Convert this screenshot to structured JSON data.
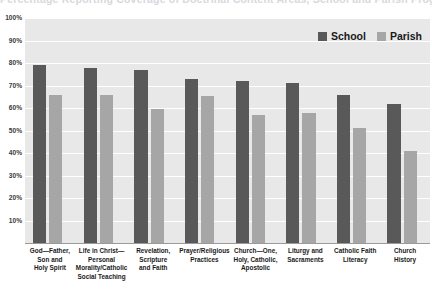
{
  "chart_data": {
    "type": "bar",
    "title": "Percentage Reporting Coverage of Doctrinal Content Areas, School and Parish Programs",
    "xlabel": "",
    "ylabel": "",
    "ylim": [
      0,
      100
    ],
    "ytick_labels": [
      "100%",
      "90%",
      "80%",
      "70%",
      "60%",
      "50%",
      "40%",
      "30%",
      "20%",
      "10%"
    ],
    "ytick_values": [
      100,
      90,
      80,
      70,
      60,
      50,
      40,
      30,
      20,
      10
    ],
    "grid": true,
    "legend_position": "top-right",
    "categories": [
      "God—Father, Son and Holy Spirit",
      "Life in Christ—Personal Morality/Catholic Social Teaching",
      "Revelation, Scripture and Faith",
      "Prayer/Religious Practices",
      "Church—One, Holy, Catholic, Apostolic",
      "Liturgy and Sacraments",
      "Catholic Faith Literacy",
      "Church History"
    ],
    "category_lines": [
      [
        "God—Father,",
        "Son and",
        "Holy Spirit"
      ],
      [
        "Life in Christ—",
        "Personal",
        "Morality/Catholic",
        "Social Teaching"
      ],
      [
        "Revelation,",
        "Scripture",
        "and Faith"
      ],
      [
        "Prayer/Religious",
        "Practices"
      ],
      [
        "Church—One,",
        "Holy, Catholic,",
        "Apostolic"
      ],
      [
        "Liturgy and",
        "Sacraments"
      ],
      [
        "Catholic Faith",
        "Literacy"
      ],
      [
        "Church",
        "History"
      ]
    ],
    "series": [
      {
        "name": "School",
        "color": "#595959",
        "values": [
          79,
          78,
          77,
          73,
          72,
          71,
          66,
          62
        ]
      },
      {
        "name": "Parish",
        "color": "#a6a6a6",
        "values": [
          66,
          66,
          59.5,
          65.5,
          57,
          58,
          51,
          41
        ]
      }
    ]
  },
  "colors": {
    "school": "#595959",
    "parish": "#a6a6a6",
    "plot_background": "#e8e8e8",
    "gridline": "#ffffff",
    "axis": "#9a9a9a",
    "text": "#1a1a1a"
  }
}
